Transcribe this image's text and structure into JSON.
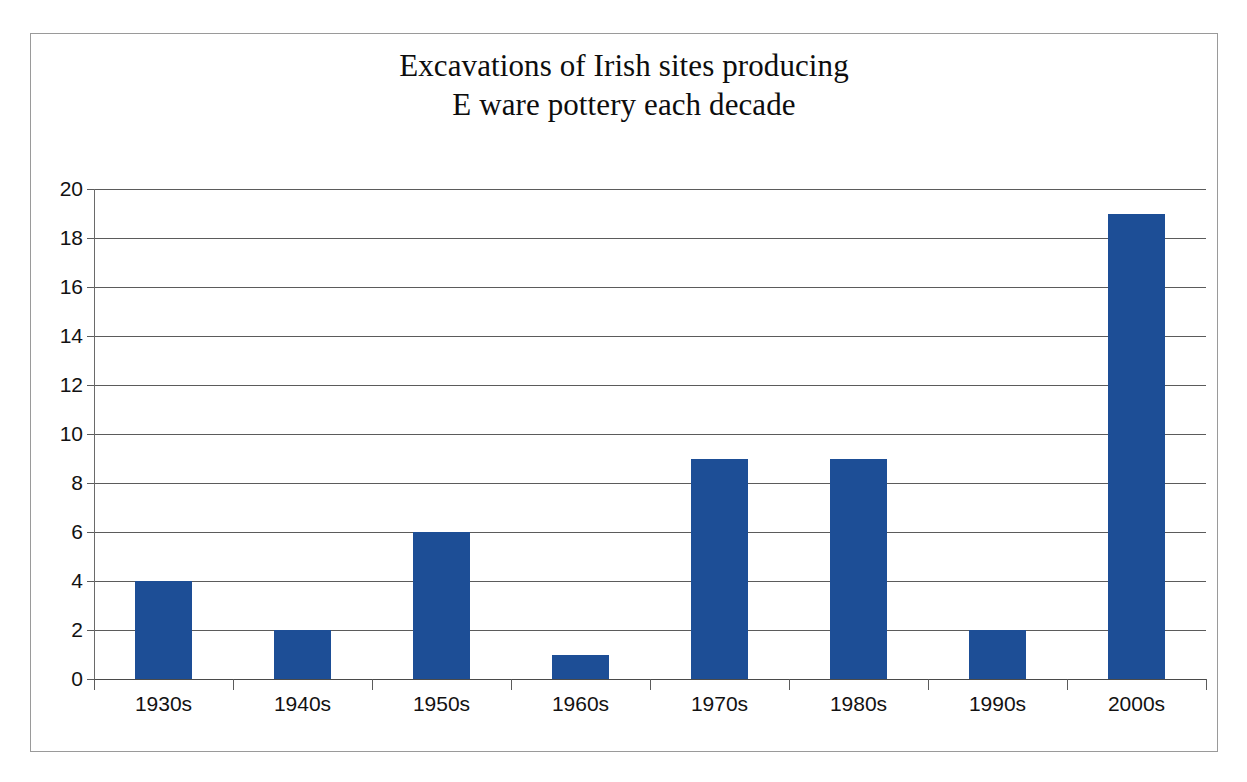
{
  "chart_data": {
    "type": "bar",
    "title": "Excavations of Irish sites producing E ware pottery each decade",
    "title_lines": [
      "Excavations of Irish sites producing",
      "E ware pottery each decade"
    ],
    "categories": [
      "1930s",
      "1940s",
      "1950s",
      "1960s",
      "1970s",
      "1980s",
      "1990s",
      "2000s"
    ],
    "values": [
      4,
      2,
      6,
      1,
      9,
      9,
      2,
      19
    ],
    "xlabel": "",
    "ylabel": "",
    "ylim": [
      0,
      20
    ],
    "ytick_step": 2,
    "yticks": [
      0,
      2,
      4,
      6,
      8,
      10,
      12,
      14,
      16,
      18,
      20
    ],
    "ytick_labels": [
      "0",
      "2",
      "4",
      "6",
      "8",
      "10",
      "12",
      "14",
      "16",
      "18",
      "20"
    ],
    "grid": true,
    "grid_axis": "y",
    "legend": false,
    "legend_position": "none",
    "bar_color": "#1d4e96",
    "gridline_color": "#5b5b5b",
    "axis_color": "#6a6a6a",
    "frame_color": "#9a9a9a",
    "background": "#ffffff",
    "text_color": "#121212"
  }
}
